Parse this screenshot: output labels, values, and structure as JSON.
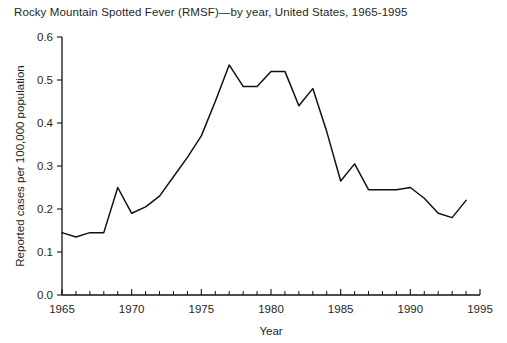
{
  "chart_data": {
    "type": "line",
    "title": "Rocky Mountain Spotted Fever (RMSF)—by year, United States, 1965-1995",
    "xlabel": "Year",
    "ylabel": "Reported cases per 100,000 population",
    "xlim": [
      1965,
      1995
    ],
    "ylim": [
      0.0,
      0.6
    ],
    "grid": false,
    "legend": null,
    "x_tick_labels": [
      "1965",
      "1970",
      "1975",
      "1980",
      "1985",
      "1990",
      "1995"
    ],
    "x_major_ticks": [
      1965,
      1970,
      1975,
      1980,
      1985,
      1990,
      1995
    ],
    "x_minor_tick_step": 1,
    "y_tick_labels": [
      "0.0",
      "0.1",
      "0.2",
      "0.3",
      "0.4",
      "0.5",
      "0.6"
    ],
    "y_major_ticks": [
      0.0,
      0.1,
      0.2,
      0.3,
      0.4,
      0.5,
      0.6
    ],
    "line_color": "#111111",
    "x": [
      1965,
      1966,
      1967,
      1968,
      1969,
      1970,
      1971,
      1972,
      1973,
      1974,
      1975,
      1976,
      1977,
      1978,
      1979,
      1980,
      1981,
      1982,
      1983,
      1984,
      1985,
      1986,
      1987,
      1988,
      1989,
      1990,
      1991,
      1992,
      1993,
      1994
    ],
    "values": [
      0.145,
      0.135,
      0.145,
      0.145,
      0.25,
      0.19,
      0.205,
      0.23,
      0.275,
      0.32,
      0.37,
      0.45,
      0.535,
      0.485,
      0.485,
      0.52,
      0.52,
      0.44,
      0.48,
      0.38,
      0.265,
      0.305,
      0.245,
      0.245,
      0.245,
      0.25,
      0.225,
      0.19,
      0.18,
      0.22
    ],
    "series": [
      {
        "name": "RMSF reported cases per 100,000 population",
        "values": [
          0.145,
          0.135,
          0.145,
          0.145,
          0.25,
          0.19,
          0.205,
          0.23,
          0.275,
          0.32,
          0.37,
          0.45,
          0.535,
          0.485,
          0.485,
          0.52,
          0.52,
          0.44,
          0.48,
          0.38,
          0.265,
          0.305,
          0.245,
          0.245,
          0.245,
          0.25,
          0.225,
          0.19,
          0.18,
          0.22
        ]
      }
    ]
  }
}
